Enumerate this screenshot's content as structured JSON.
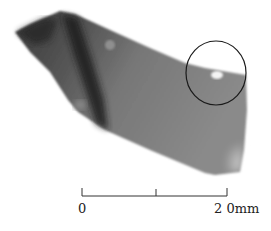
{
  "figure": {
    "highlight": "circled region"
  },
  "scale_bar": {
    "start_label": "0",
    "end_label": "2 0mm",
    "length_mm": 20,
    "divisions": 2
  },
  "colors": {
    "background": "#ffffff",
    "artifact_dark": "#2e2e2e",
    "artifact_mid": "#6f6f6f",
    "artifact_light": "#9a9a9a",
    "ink": "#222222"
  }
}
